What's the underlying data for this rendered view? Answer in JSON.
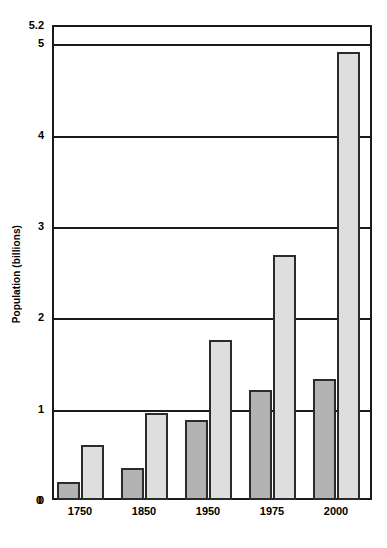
{
  "chart_data": {
    "type": "bar",
    "title": "",
    "subtitle": "",
    "xlabel": "",
    "ylabel": "Population (billions)",
    "categories": [
      "1750",
      "1850",
      "1950",
      "1975",
      "2000"
    ],
    "series": [
      {
        "name": "less-developed-regions-dark",
        "values": [
          0.2,
          0.35,
          0.88,
          1.2,
          1.32
        ],
        "color": "#b3b3b3"
      },
      {
        "name": "more-developed-regions-light",
        "values": [
          0.6,
          0.95,
          1.75,
          2.68,
          4.9
        ],
        "color": "#dedede"
      }
    ],
    "ylim": [
      0,
      5.2
    ],
    "xlim_note": "categorical",
    "y_ticks": [
      "0",
      "1",
      "2",
      "3",
      "4",
      "5",
      "5.2"
    ],
    "y_tick_values": [
      0,
      1,
      2,
      3,
      4,
      5,
      5.2
    ],
    "gridlines": [
      1,
      2,
      3,
      4,
      5
    ],
    "grid": true,
    "legend": "none",
    "annotations": []
  },
  "axis": {
    "y_title": "Population (billions)",
    "zero_label": "0"
  }
}
